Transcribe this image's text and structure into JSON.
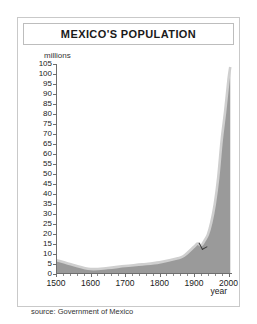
{
  "figure": {
    "title": "MEXICO'S POPULATION",
    "source_note": "source: Government of Mexico"
  },
  "chart_data": {
    "type": "area",
    "title": "MEXICO'S POPULATION",
    "xlabel": "year",
    "ylabel": "millions",
    "xlim": [
      1500,
      2010
    ],
    "ylim": [
      0,
      105
    ],
    "grid": false,
    "legend": null,
    "y_ticks": [
      0,
      5,
      10,
      15,
      20,
      25,
      30,
      35,
      40,
      45,
      50,
      55,
      60,
      65,
      70,
      75,
      80,
      85,
      90,
      95,
      100,
      105
    ],
    "y_tick_labels": [
      "0",
      "5",
      "10",
      "15",
      "20",
      "25",
      "30",
      "35",
      "40",
      "45",
      "50",
      "55",
      "60",
      "65",
      "70",
      "75",
      "80",
      "85",
      "90",
      "95",
      "100",
      "105"
    ],
    "x_ticks": [
      1500,
      1600,
      1700,
      1800,
      1900,
      2000
    ],
    "x_tick_labels": [
      "1500",
      "1600",
      "1700",
      "1800",
      "1900",
      "2000"
    ],
    "x_minor_step": 20,
    "series": [
      {
        "name": "Population",
        "fill_color": "#9a9a9a",
        "edge_color": "#cfcfcf",
        "x": [
          1500,
          1550,
          1600,
          1650,
          1700,
          1750,
          1800,
          1850,
          1870,
          1900,
          1910,
          1921,
          1930,
          1940,
          1950,
          1960,
          1970,
          1980,
          1990,
          2000,
          2005
        ],
        "values": [
          7.0,
          4.5,
          2.5,
          3.0,
          4.0,
          4.8,
          5.8,
          7.7,
          9.0,
          13.6,
          15.2,
          14.3,
          16.6,
          19.7,
          25.8,
          34.9,
          48.2,
          66.8,
          81.2,
          97.5,
          103.5
        ]
      }
    ],
    "annotations": [
      {
        "name": "kink-marker",
        "x": 1921,
        "y": 14.3,
        "label": ""
      }
    ]
  }
}
